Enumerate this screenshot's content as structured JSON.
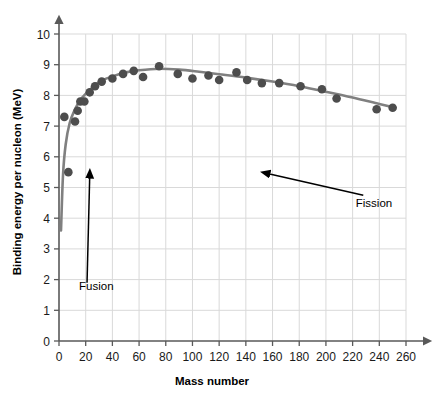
{
  "chart_data": {
    "type": "scatter",
    "title": "",
    "xlabel": "Mass number",
    "ylabel": "Binding energy per nucleon (MeV)",
    "xlim": [
      0,
      260
    ],
    "ylim": [
      0,
      10
    ],
    "xticks": [
      0,
      20,
      40,
      60,
      80,
      100,
      120,
      140,
      160,
      180,
      200,
      220,
      240,
      260
    ],
    "yticks": [
      0,
      1,
      2,
      3,
      4,
      5,
      6,
      7,
      8,
      9,
      10
    ],
    "grid": true,
    "legend": "none",
    "marker_color": "#4d4d4d",
    "line_color": "#808080",
    "grid_color": "#d9d9d9",
    "axis_color": "#595959",
    "points": [
      {
        "x": 4,
        "y": 7.3
      },
      {
        "x": 7,
        "y": 5.5
      },
      {
        "x": 12,
        "y": 7.15
      },
      {
        "x": 14,
        "y": 7.5
      },
      {
        "x": 16,
        "y": 7.8
      },
      {
        "x": 19,
        "y": 7.8
      },
      {
        "x": 23,
        "y": 8.1
      },
      {
        "x": 27,
        "y": 8.3
      },
      {
        "x": 32,
        "y": 8.45
      },
      {
        "x": 40,
        "y": 8.55
      },
      {
        "x": 48,
        "y": 8.7
      },
      {
        "x": 56,
        "y": 8.8
      },
      {
        "x": 63,
        "y": 8.6
      },
      {
        "x": 75,
        "y": 8.95
      },
      {
        "x": 89,
        "y": 8.7
      },
      {
        "x": 100,
        "y": 8.55
      },
      {
        "x": 112,
        "y": 8.65
      },
      {
        "x": 120,
        "y": 8.5
      },
      {
        "x": 133,
        "y": 8.75
      },
      {
        "x": 141,
        "y": 8.5
      },
      {
        "x": 152,
        "y": 8.4
      },
      {
        "x": 165,
        "y": 8.4
      },
      {
        "x": 181,
        "y": 8.3
      },
      {
        "x": 197,
        "y": 8.2
      },
      {
        "x": 208,
        "y": 7.9
      },
      {
        "x": 238,
        "y": 7.55
      },
      {
        "x": 250,
        "y": 7.6
      }
    ],
    "curve": [
      {
        "x": 1.5,
        "y": 3.6
      },
      {
        "x": 3,
        "y": 5.4
      },
      {
        "x": 5,
        "y": 6.4
      },
      {
        "x": 8,
        "y": 7.1
      },
      {
        "x": 12,
        "y": 7.55
      },
      {
        "x": 16,
        "y": 7.85
      },
      {
        "x": 20,
        "y": 8.05
      },
      {
        "x": 26,
        "y": 8.3
      },
      {
        "x": 32,
        "y": 8.48
      },
      {
        "x": 40,
        "y": 8.62
      },
      {
        "x": 50,
        "y": 8.75
      },
      {
        "x": 60,
        "y": 8.82
      },
      {
        "x": 75,
        "y": 8.87
      },
      {
        "x": 90,
        "y": 8.84
      },
      {
        "x": 105,
        "y": 8.77
      },
      {
        "x": 120,
        "y": 8.69
      },
      {
        "x": 140,
        "y": 8.58
      },
      {
        "x": 160,
        "y": 8.45
      },
      {
        "x": 180,
        "y": 8.3
      },
      {
        "x": 200,
        "y": 8.12
      },
      {
        "x": 220,
        "y": 7.93
      },
      {
        "x": 240,
        "y": 7.72
      },
      {
        "x": 252,
        "y": 7.6
      }
    ],
    "annotations": [
      {
        "name": "fusion",
        "label": "Fusion",
        "label_x": 28,
        "label_y": 1.65,
        "arrow_from": {
          "x": 21,
          "y": 1.9
        },
        "arrow_to": {
          "x": 23,
          "y": 5.35
        }
      },
      {
        "name": "fission",
        "label": "Fission",
        "label_x": 236,
        "label_y": 4.35,
        "arrow_from": {
          "x": 228,
          "y": 4.75
        },
        "arrow_to": {
          "x": 157,
          "y": 5.45
        }
      }
    ]
  }
}
